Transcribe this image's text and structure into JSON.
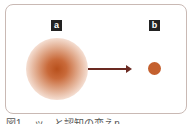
{
  "figure": {
    "panel_a_label": "a",
    "panel_b_label": "b",
    "caption": "図1 …ッ…と認知の変えn",
    "colors": {
      "border": "#c9b9b4",
      "blur_center": "#b8501c",
      "dot": "#c4602e",
      "arrow": "#6b2a22",
      "label_bg": "#222222"
    }
  }
}
